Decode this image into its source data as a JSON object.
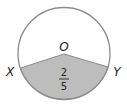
{
  "diagram": {
    "type": "circle-sector",
    "center_label": "O",
    "point_left_label": "X",
    "point_right_label": "Y",
    "fraction": {
      "numerator": "2",
      "denominator": "5"
    },
    "colors": {
      "outline": "#8a8a8a",
      "shaded": "#bdbdbd",
      "background": "#ffffff",
      "text": "#222222"
    }
  }
}
